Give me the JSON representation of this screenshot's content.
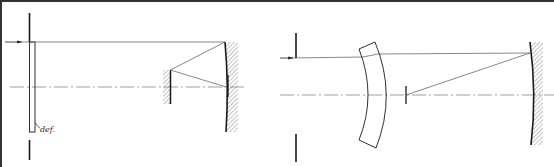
{
  "figure": {
    "left_diagram": {
      "name": "Schmidt-type system with corrector plate and folding flat",
      "elements": [
        "aperture-stop",
        "corrector-plate",
        "primary-concave-mirror",
        "folding-flat-mirror",
        "focal-plane"
      ],
      "labels": [
        {
          "text": "def.",
          "target": "corrector-plate"
        }
      ]
    },
    "right_diagram": {
      "name": "Maksutov-type system with meniscus corrector",
      "elements": [
        "aperture-stop",
        "meniscus-lens",
        "primary-concave-mirror",
        "focal-plane"
      ]
    }
  },
  "colors": {
    "line": "#1a1a1a",
    "thin_line": "#555555",
    "axis": "#777777",
    "border": "#333333",
    "background": "#ffffff"
  }
}
